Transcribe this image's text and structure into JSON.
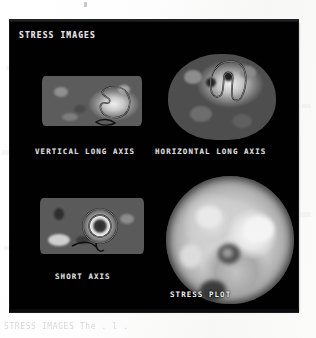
{
  "figure": {
    "panel_title": "STRESS IMAGES",
    "background_color": "#010101",
    "label_color": "#dcdcdc",
    "page_color": "#ffffff",
    "panels": [
      {
        "id": "vertical-long-axis",
        "label": "VERTICAL LONG AXIS",
        "modality": "grayscale-tomographic-slice",
        "has_contour": true
      },
      {
        "id": "horizontal-long-axis",
        "label": "HORIZONTAL LONG AXIS",
        "modality": "grayscale-tomographic-slice",
        "has_contour": true
      },
      {
        "id": "short-axis",
        "label": "SHORT AXIS",
        "modality": "grayscale-tomographic-slice",
        "has_contour": true
      },
      {
        "id": "stress-plot",
        "label": "STRESS PLOT",
        "modality": "polar-bullseye-map",
        "has_contour": false
      }
    ]
  },
  "scan": {
    "caption_text": "STRESS IMAGES    The  .  l  .",
    "top_mark": "pencil-tick"
  }
}
